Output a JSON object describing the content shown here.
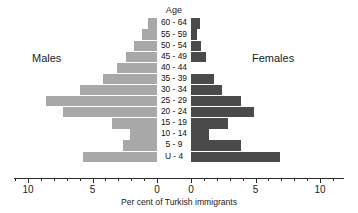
{
  "chart_data": {
    "type": "bar",
    "subtype": "population-pyramid",
    "title": "",
    "xlabel": "Per cent of Turkish immigrants",
    "ylabel": "Age",
    "categories": [
      "60 - 64",
      "55 - 59",
      "50 - 54",
      "45 - 49",
      "40 - 44",
      "35 - 39",
      "30 - 34",
      "25 - 29",
      "20 - 24",
      "15 - 19",
      "10 - 14",
      "5 - 9",
      "U - 4"
    ],
    "series": [
      {
        "name": "Males",
        "color": "#a8a8a8",
        "side": "left",
        "values": [
          0.7,
          1.2,
          1.8,
          2.4,
          3.1,
          4.2,
          6.0,
          8.6,
          7.3,
          3.5,
          2.1,
          2.6,
          5.7
        ]
      },
      {
        "name": "Females",
        "color": "#4a4a4a",
        "side": "right",
        "values": [
          0.7,
          0.5,
          0.8,
          1.2,
          0.0,
          1.8,
          2.4,
          3.9,
          4.9,
          2.9,
          1.4,
          3.9,
          6.9
        ]
      }
    ],
    "xlim": [
      -11.1,
      11.1
    ],
    "x_tick_values": [
      10,
      5,
      0,
      0,
      5,
      10
    ],
    "x_tick_labels": [
      "10",
      "5",
      "0",
      "0",
      "5",
      "10"
    ],
    "minor_ticks_per_interval": 5,
    "grid": false,
    "legend": "inline-side-labels"
  },
  "labels": {
    "age_header": "Age",
    "males": "Males",
    "females": "Females",
    "axis_caption": "Per cent of Turkish immigrants"
  },
  "geometry": {
    "left_zero_px": 157,
    "right_zero_px": 191,
    "px_per_unit": 12.9,
    "rows_top_px": 18,
    "row_height_px": 11.1
  }
}
